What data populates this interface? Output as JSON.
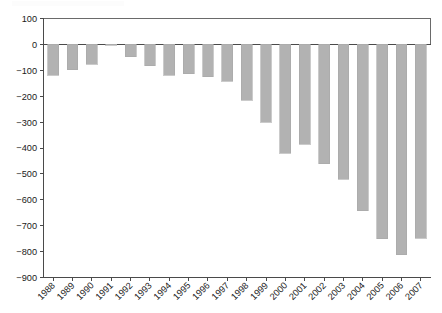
{
  "chart_data": {
    "type": "bar",
    "title": "",
    "subtitle": "",
    "xlabel": "",
    "ylabel": "",
    "categories": [
      "1988",
      "1989",
      "1990",
      "1991",
      "1992",
      "1993",
      "1994",
      "1995",
      "1996",
      "1997",
      "1998",
      "1999",
      "2000",
      "2001",
      "2002",
      "2003",
      "2004",
      "2005",
      "2006",
      "2007"
    ],
    "values": [
      -120,
      -98,
      -77,
      -3,
      -47,
      -82,
      -120,
      -113,
      -125,
      -142,
      -215,
      -300,
      -420,
      -385,
      -460,
      -520,
      -642,
      -750,
      -812,
      -748
    ],
    "series": [
      {
        "name": "",
        "values": [
          -120,
          -98,
          -77,
          -3,
          -47,
          -82,
          -120,
          -113,
          -125,
          -142,
          -215,
          -300,
          -420,
          -385,
          -460,
          -520,
          -642,
          -750,
          -812,
          -748
        ]
      }
    ],
    "ylim": [
      -900,
      100
    ],
    "yticks": [
      100,
      0,
      -100,
      -200,
      -300,
      -400,
      -500,
      -600,
      -700,
      -800,
      -900
    ],
    "ytick_labels": [
      "100",
      "0",
      "−100",
      "−200",
      "−300",
      "−400",
      "−500",
      "−600",
      "−700",
      "−800",
      "−900"
    ],
    "grid": false,
    "legend": null,
    "legend_position": "none",
    "bar_color": "#b2b2b2",
    "bar_edge_color": "#a8a8a8",
    "axis_color": "#4a4a4a",
    "background_color": "#ffffff",
    "xtick_rotation": -45
  }
}
